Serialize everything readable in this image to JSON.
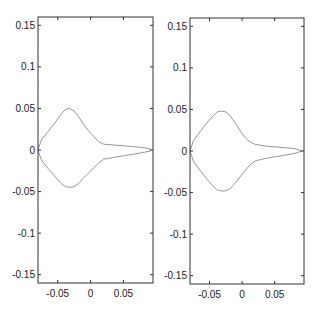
{
  "chart_data": [
    {
      "type": "line",
      "title": "",
      "xlabel": "",
      "ylabel": "",
      "xlim": [
        -0.08,
        0.095
      ],
      "ylim": [
        -0.16,
        0.16
      ],
      "grid": false,
      "legend": null,
      "xticks": [
        -0.05,
        0,
        0.05
      ],
      "xtick_labels": [
        "-0.05",
        "0",
        "0.05"
      ],
      "yticks": [
        0.15,
        0.1,
        0.05,
        0,
        -0.05,
        -0.1,
        -0.15
      ],
      "ytick_labels": [
        "0.15",
        "0.1",
        "0.05",
        "0",
        "-0.05",
        "-0.1",
        "-0.15"
      ],
      "line_color": "#8a8a8a",
      "series": [
        {
          "name": "upper contour",
          "x": [
            -0.08,
            -0.075,
            -0.065,
            -0.055,
            -0.045,
            -0.038,
            -0.032,
            -0.025,
            -0.018,
            -0.01,
            -0.002,
            0.005,
            0.012,
            0.02,
            0.035,
            0.05,
            0.065,
            0.08,
            0.092
          ],
          "y": [
            0.0,
            0.012,
            0.022,
            0.032,
            0.043,
            0.049,
            0.05,
            0.047,
            0.04,
            0.03,
            0.022,
            0.016,
            0.01,
            0.007,
            0.006,
            0.005,
            0.004,
            0.003,
            0.001
          ]
        },
        {
          "name": "lower contour",
          "x": [
            -0.08,
            -0.075,
            -0.065,
            -0.055,
            -0.045,
            -0.038,
            -0.032,
            -0.025,
            -0.018,
            -0.01,
            -0.002,
            0.005,
            0.012,
            0.02,
            0.035,
            0.05,
            0.065,
            0.08,
            0.092
          ],
          "y": [
            0.0,
            -0.012,
            -0.022,
            -0.031,
            -0.04,
            -0.044,
            -0.045,
            -0.044,
            -0.04,
            -0.033,
            -0.027,
            -0.021,
            -0.016,
            -0.011,
            -0.009,
            -0.007,
            -0.005,
            -0.003,
            -0.001
          ]
        }
      ]
    },
    {
      "type": "line",
      "title": "",
      "xlabel": "",
      "ylabel": "",
      "xlim": [
        -0.08,
        0.095
      ],
      "ylim": [
        -0.16,
        0.16
      ],
      "grid": false,
      "legend": null,
      "xticks": [
        -0.05,
        0,
        0.05
      ],
      "xtick_labels": [
        "-0.05",
        "0",
        "0.05"
      ],
      "yticks": [
        0.15,
        0.1,
        0.05,
        0,
        -0.05,
        -0.1,
        -0.15
      ],
      "ytick_labels": [
        "0.15",
        "0.1",
        "0.05",
        "0",
        "-0.05",
        "-0.1",
        "-0.15"
      ],
      "line_color": "#8a8a8a",
      "series": [
        {
          "name": "upper contour",
          "x": [
            -0.08,
            -0.075,
            -0.065,
            -0.055,
            -0.045,
            -0.038,
            -0.032,
            -0.025,
            -0.018,
            -0.01,
            -0.002,
            0.005,
            0.012,
            0.02,
            0.035,
            0.05,
            0.065,
            0.08,
            0.092
          ],
          "y": [
            0.0,
            0.012,
            0.023,
            0.033,
            0.042,
            0.047,
            0.048,
            0.047,
            0.042,
            0.033,
            0.023,
            0.016,
            0.011,
            0.008,
            0.006,
            0.005,
            0.004,
            0.003,
            0.0
          ]
        },
        {
          "name": "lower contour",
          "x": [
            -0.08,
            -0.075,
            -0.065,
            -0.055,
            -0.045,
            -0.038,
            -0.032,
            -0.025,
            -0.018,
            -0.01,
            -0.002,
            0.005,
            0.012,
            0.02,
            0.035,
            0.05,
            0.065,
            0.08,
            0.092
          ],
          "y": [
            0.0,
            -0.012,
            -0.023,
            -0.033,
            -0.042,
            -0.047,
            -0.048,
            -0.048,
            -0.045,
            -0.038,
            -0.03,
            -0.023,
            -0.017,
            -0.012,
            -0.009,
            -0.007,
            -0.005,
            -0.003,
            0.0
          ]
        }
      ]
    }
  ],
  "figure": {
    "panels": [
      {
        "x0": 38,
        "y0": 17,
        "x1": 153,
        "y1": 283
      },
      {
        "x0": 190,
        "y0": 18,
        "x1": 304,
        "y1": 284
      }
    ]
  }
}
